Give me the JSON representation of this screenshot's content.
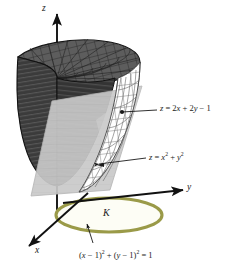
{
  "figure": {
    "background_color": "#ffffff",
    "axes": [
      {
        "name": "z-axis",
        "label": "z"
      },
      {
        "name": "y-axis",
        "label": "y"
      },
      {
        "name": "x-axis",
        "label": "x"
      }
    ],
    "annotations": [
      {
        "name": "plane-equation",
        "text": "z = 2x + 2y − 1",
        "parts": {
          "lhs": "z",
          "eq": " = ",
          "t1": "2",
          "v1": "x",
          "p1": " + ",
          "t2": "2",
          "v2": "y",
          "p2": " − 1"
        }
      },
      {
        "name": "paraboloid-equation",
        "text": "z = x² + y²",
        "parts": {
          "lhs": "z",
          "eq": " = ",
          "v1": "x",
          "e1": "2",
          "p1": " + ",
          "v2": "y",
          "e2": "2"
        }
      },
      {
        "name": "disk-equation",
        "text": "(x − 1)² + (y − 1)² = 1",
        "parts": {
          "o1": "(",
          "v1": "x",
          "m1": " − 1)",
          "e1": "2",
          "p1": " + (",
          "v2": "y",
          "m2": " − 1)",
          "e2": "2",
          "eq": " = 1"
        }
      }
    ],
    "region": {
      "name": "disk-region",
      "label": "K",
      "stroke_color": "#9a9a48",
      "fill_color": "#fdfdf5"
    },
    "surfaces": [
      {
        "name": "paraboloid-cut-face",
        "color": "#3c3c3c",
        "description": "dark striped vertical cut face of paraboloid"
      },
      {
        "name": "paraboloid-top-mesh",
        "color": "#5a5a5a",
        "description": "meshed top rim surface of paraboloid"
      },
      {
        "name": "cutting-plane",
        "color": "#c8c8c8",
        "description": "light gray slanted plane z = 2x + 2y - 1"
      },
      {
        "name": "paraboloid-mesh-wall",
        "color": "#ffffff",
        "description": "white gridded paraboloid wall above the plane"
      }
    ]
  }
}
